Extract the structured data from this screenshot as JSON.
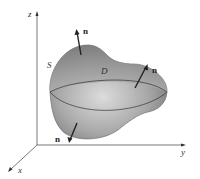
{
  "diagram": {
    "axes": {
      "z_label": "z",
      "y_label": "y",
      "x_label": "x"
    },
    "surface_label": "S",
    "region_label": "D",
    "normal_labels": [
      "n",
      "n",
      "n"
    ],
    "colors": {
      "surface_dark": "#6e6e6e",
      "surface_light": "#d8d8d8",
      "axis": "#444444",
      "background": "#ffffff"
    }
  }
}
